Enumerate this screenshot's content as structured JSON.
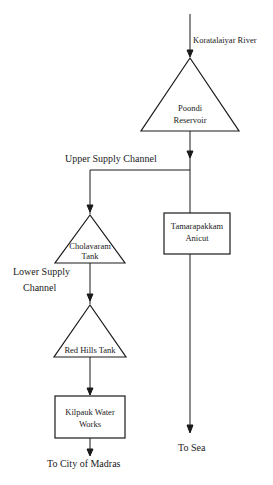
{
  "diagram": {
    "type": "flowchart",
    "colors": {
      "stroke": "#1a1a1a",
      "background": "#ffffff"
    },
    "labels": {
      "source": "Koratalaiyar River",
      "upper_channel": "Upper Supply Channel",
      "lower_channel_line1": "Lower Supply",
      "lower_channel_line2": "Channel",
      "to_city": "To City of Madras",
      "to_sea": "To Sea"
    },
    "nodes": {
      "poondi": {
        "shape": "triangle",
        "line1": "Poondi",
        "line2": "Reservoir"
      },
      "cholavaram": {
        "shape": "triangle",
        "line1": "Cholavaram",
        "line2": "Tank"
      },
      "red_hills": {
        "shape": "triangle",
        "line1": "Red Hills Tank"
      },
      "tamarapakkam": {
        "shape": "box",
        "line1": "Tamarapakkam",
        "line2": "Anicut"
      },
      "kilpauk": {
        "shape": "box",
        "line1": "Kilpauk Water",
        "line2": "Works"
      }
    },
    "edges": [
      [
        "Koratalaiyar River",
        "Poondi Reservoir"
      ],
      [
        "Poondi Reservoir",
        "Upper Supply Channel"
      ],
      [
        "Upper Supply Channel",
        "Cholavaram Tank"
      ],
      [
        "Poondi Reservoir",
        "Tamarapakkam Anicut"
      ],
      [
        "Cholavaram Tank",
        "Red Hills Tank"
      ],
      [
        "Red Hills Tank",
        "Kilpauk Water Works"
      ],
      [
        "Kilpauk Water Works",
        "To City of Madras"
      ],
      [
        "Tamarapakkam Anicut",
        "To Sea"
      ]
    ]
  }
}
